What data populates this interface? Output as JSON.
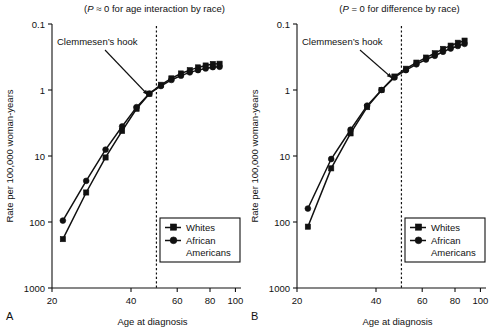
{
  "figure": {
    "panels": [
      {
        "letter": "A",
        "title": "(P ≈ 0 for age interaction by race)",
        "title_p": "P",
        "title_rest": " ≈ 0 for age interaction by race)",
        "title_open": "(",
        "annotation": "Clemmesen’s hook",
        "hook_age": 50
      },
      {
        "letter": "B",
        "title": "(P = 0 for difference by race)",
        "title_p": "P",
        "title_rest": " = 0 for difference by race)",
        "title_open": "(",
        "annotation": "Clemmesen’s hook",
        "hook_age": 50
      }
    ],
    "axes": {
      "ylabel": "Rate per 100,000 woman-years",
      "xlabel": "Age at diagnosis",
      "yticks": [
        "1000",
        "100",
        "10",
        "1",
        "0.1"
      ],
      "xticks": [
        "20",
        "40",
        "60",
        "80",
        "100"
      ]
    },
    "legend": {
      "entries": [
        {
          "name": "Whites",
          "marker": "square-marker",
          "lines": [
            "Whites"
          ]
        },
        {
          "name": "African Americans",
          "marker": "circle-marker",
          "lines": [
            "African",
            "Americans"
          ]
        }
      ]
    },
    "colors": {
      "ink": "#111111",
      "background": "#ffffff"
    }
  },
  "chart_data": [
    {
      "type": "line",
      "panel": "A",
      "title": "(P ≈ 0 for age interaction by race)",
      "xlabel": "Age at diagnosis",
      "ylabel": "Rate per 100,000 woman-years",
      "xscale": "log",
      "yscale": "log",
      "xlim": [
        20,
        105
      ],
      "ylim": [
        0.1,
        1000
      ],
      "xticks": [
        20,
        40,
        60,
        80,
        100
      ],
      "yticks": [
        0.1,
        1,
        10,
        100,
        1000
      ],
      "grid": false,
      "legend_position": "lower-right",
      "annotations": [
        {
          "text": "Clemmesen’s hook",
          "points_to_age": 50,
          "points_to_rate": 100
        },
        {
          "type": "vline",
          "age": 50,
          "style": "dotted"
        }
      ],
      "x": [
        22,
        27,
        32,
        37,
        42,
        47,
        52,
        57,
        62,
        67,
        72,
        77,
        82,
        87
      ],
      "series": [
        {
          "name": "Whites",
          "marker": "square",
          "values": [
            0.55,
            2.8,
            9.5,
            24,
            52,
            88,
            120,
            150,
            178,
            200,
            220,
            235,
            248,
            250
          ]
        },
        {
          "name": "African Americans",
          "marker": "circle",
          "values": [
            1.05,
            4.2,
            12.5,
            28,
            55,
            88,
            115,
            142,
            165,
            185,
            200,
            212,
            222,
            225
          ]
        }
      ]
    },
    {
      "type": "line",
      "panel": "B",
      "title": "(P = 0 for difference by race)",
      "xlabel": "Age at diagnosis",
      "ylabel": "Rate per 100,000 woman-years",
      "xscale": "log",
      "yscale": "log",
      "xlim": [
        20,
        105
      ],
      "ylim": [
        0.1,
        1000
      ],
      "xticks": [
        20,
        40,
        60,
        80,
        100
      ],
      "yticks": [
        0.1,
        1,
        10,
        100,
        1000
      ],
      "grid": false,
      "legend_position": "lower-right",
      "annotations": [
        {
          "text": "Clemmesen’s hook",
          "points_to_age": 50,
          "points_to_rate": 170
        },
        {
          "type": "vline",
          "age": 50,
          "style": "dotted"
        }
      ],
      "x": [
        22,
        27,
        32,
        37,
        42,
        47,
        52,
        57,
        62,
        67,
        72,
        77,
        82,
        87
      ],
      "series": [
        {
          "name": "Whites",
          "marker": "square",
          "values": [
            0.85,
            6.5,
            22,
            55,
            100,
            160,
            210,
            260,
            310,
            360,
            420,
            470,
            520,
            560
          ]
        },
        {
          "name": "African Americans",
          "marker": "circle",
          "values": [
            1.6,
            9.0,
            25,
            58,
            100,
            155,
            200,
            245,
            290,
            330,
            380,
            425,
            465,
            500
          ]
        }
      ]
    }
  ]
}
